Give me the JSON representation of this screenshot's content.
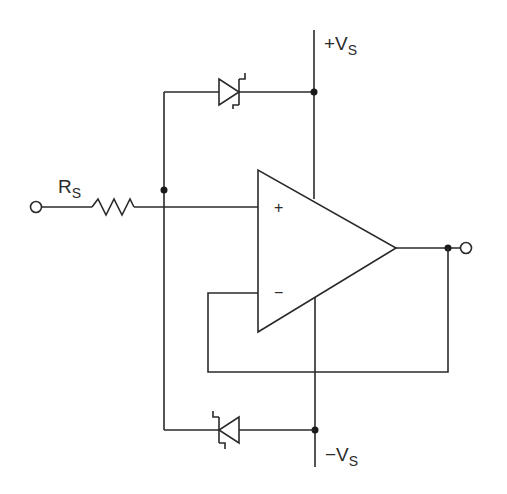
{
  "diagram": {
    "type": "circuit-schematic",
    "labels": {
      "resistor_main": "R",
      "resistor_sub": "S",
      "pos_supply_sign": "+V",
      "pos_supply_sub": "S",
      "neg_supply_sign": "−V",
      "neg_supply_sub": "S",
      "plus_input": "+",
      "minus_input": "−"
    },
    "components": [
      {
        "id": "input-terminal",
        "kind": "terminal"
      },
      {
        "id": "Rs",
        "kind": "resistor"
      },
      {
        "id": "D1",
        "kind": "zener-diode",
        "position": "top",
        "connects": [
          "input-node",
          "+Vs"
        ]
      },
      {
        "id": "D2",
        "kind": "zener-diode",
        "position": "bottom",
        "connects": [
          "-Vs",
          "input-node"
        ]
      },
      {
        "id": "U1",
        "kind": "op-amp"
      },
      {
        "id": "output-terminal",
        "kind": "terminal"
      }
    ],
    "colors": {
      "line": "#2a2a2a",
      "background": "#ffffff"
    }
  }
}
